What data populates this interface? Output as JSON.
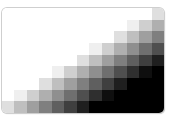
{
  "gradient_grid": {
    "columns": 13,
    "rows": 9,
    "direction": "white top-left to black bottom-right",
    "values": [
      [
        255,
        255,
        255,
        255,
        255,
        255,
        255,
        255,
        255,
        255,
        255,
        255,
        223
      ],
      [
        255,
        255,
        255,
        255,
        255,
        255,
        255,
        255,
        255,
        255,
        239,
        207,
        175
      ],
      [
        255,
        255,
        255,
        255,
        255,
        255,
        255,
        255,
        255,
        223,
        191,
        159,
        127
      ],
      [
        255,
        255,
        255,
        255,
        255,
        255,
        255,
        239,
        207,
        175,
        143,
        111,
        79
      ],
      [
        255,
        255,
        255,
        255,
        255,
        255,
        223,
        191,
        159,
        127,
        95,
        63,
        31
      ],
      [
        255,
        255,
        255,
        255,
        239,
        207,
        175,
        143,
        111,
        79,
        47,
        15,
        0
      ],
      [
        255,
        255,
        255,
        223,
        191,
        159,
        127,
        95,
        63,
        31,
        0,
        0,
        0
      ],
      [
        255,
        239,
        207,
        175,
        143,
        111,
        79,
        47,
        15,
        0,
        0,
        0,
        0
      ],
      [
        223,
        191,
        159,
        127,
        95,
        63,
        31,
        0,
        0,
        0,
        0,
        0,
        0
      ]
    ]
  }
}
